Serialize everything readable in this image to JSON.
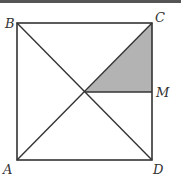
{
  "figure": {
    "type": "geometry-diagram",
    "colors": {
      "stroke": "#333333",
      "shade": "#b3b3b3",
      "top_rule": "#555555"
    },
    "labels": {
      "A": "A",
      "B": "B",
      "C": "C",
      "D": "D",
      "M": "M"
    },
    "points": {
      "A": [
        17,
        160
      ],
      "B": [
        17,
        23
      ],
      "C": [
        152,
        23
      ],
      "D": [
        152,
        160
      ],
      "O": [
        85,
        92
      ],
      "M": [
        152,
        92
      ]
    },
    "shaded_region": [
      "O",
      "C",
      "M"
    ]
  }
}
